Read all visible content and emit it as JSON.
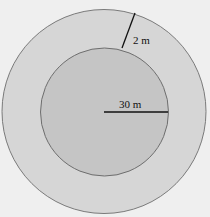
{
  "diagram": {
    "type": "concentric-circles",
    "outer_circle": {
      "cx": 104,
      "cy": 111.5,
      "r": 102,
      "fill": "#d6d6d6",
      "stroke": "#7a7a7a"
    },
    "inner_circle": {
      "cx": 104.5,
      "cy": 112,
      "r": 64,
      "fill": "#c5c5c5",
      "stroke": "#6e6e6e"
    },
    "radius_label": "30 m",
    "width_label": "2 m",
    "background": "#efefef"
  }
}
